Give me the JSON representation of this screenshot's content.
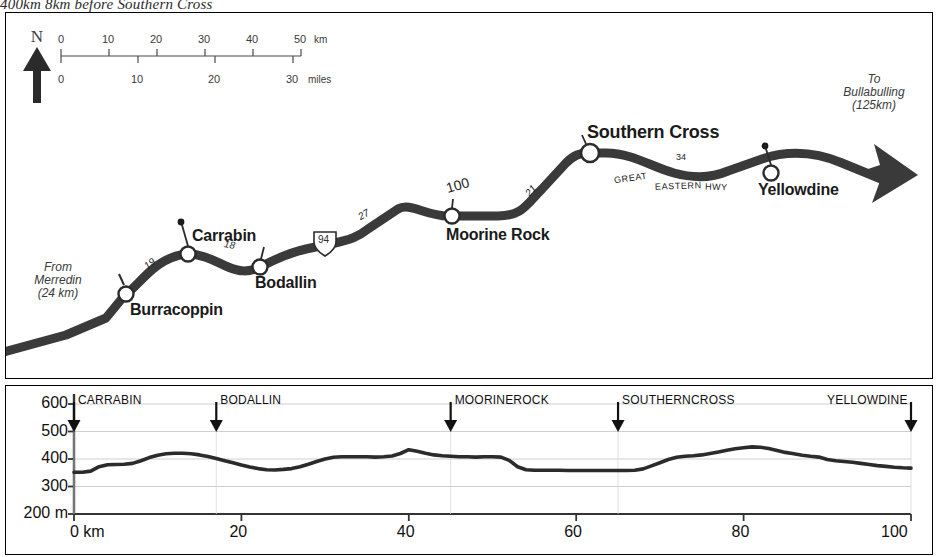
{
  "caption": "400km  8km before Southern Cross",
  "map": {
    "north_label": "N",
    "north_icon": "north-arrow-icon",
    "scale": {
      "km_ticks": [
        "0",
        "10",
        "20",
        "30",
        "40",
        "50"
      ],
      "km_unit": "km",
      "miles_ticks": [
        "0",
        "10",
        "20",
        "30"
      ],
      "miles_unit": "miles"
    },
    "origin_note": "From\nMerredin\n(24 km)",
    "origin_note_lines": [
      "From",
      "Merredin",
      "(24 km)"
    ],
    "destination_note_lines": [
      "To",
      "Bullabulling",
      "(125km)"
    ],
    "towns": [
      {
        "name": "Burracoppin"
      },
      {
        "name": "Carrabin"
      },
      {
        "name": "Bodallin"
      },
      {
        "name": "Moorine Rock"
      },
      {
        "name": "Southern Cross"
      },
      {
        "name": "Yellowdine"
      }
    ],
    "segment_distances": [
      "19",
      "18",
      "27",
      "21",
      "34"
    ],
    "road_numbers": [
      "94",
      "100"
    ],
    "highway_words": [
      "GREAT",
      "EASTERN",
      "HWY"
    ],
    "colors": {
      "road": "#3a3a3a",
      "border": "#000000",
      "text": "#1a1a1a"
    }
  },
  "chart_data": {
    "type": "line",
    "title": "",
    "xlabel": "0 km",
    "ylabel": "200 m",
    "xlim": [
      0,
      100
    ],
    "ylim": [
      200,
      600
    ],
    "grid": true,
    "yticks": [
      "200 m",
      "300",
      "400",
      "500",
      "600"
    ],
    "ytick_values": [
      200,
      300,
      400,
      500,
      600
    ],
    "xticks": [
      "0 km",
      "20",
      "40",
      "60",
      "80",
      "100"
    ],
    "xtick_values": [
      0,
      20,
      40,
      60,
      80,
      100
    ],
    "markers": [
      {
        "label": "CARRABIN",
        "km": 0
      },
      {
        "label": "BODALLIN",
        "km": 17
      },
      {
        "label": "MOORINEROCK",
        "km": 45
      },
      {
        "label": "SOUTHERNCROSS",
        "km": 65
      },
      {
        "label": "YELLOWDINE",
        "km": 100
      }
    ],
    "x": [
      0,
      1,
      2,
      3,
      4,
      5,
      6,
      7,
      8,
      9,
      10,
      11,
      12,
      13,
      14,
      15,
      16,
      17,
      18,
      19,
      20,
      21,
      22,
      23,
      24,
      25,
      26,
      27,
      28,
      29,
      30,
      31,
      32,
      33,
      34,
      35,
      36,
      37,
      38,
      39,
      40,
      41,
      42,
      43,
      44,
      45,
      46,
      47,
      48,
      49,
      50,
      51,
      52,
      53,
      54,
      55,
      56,
      57,
      58,
      59,
      60,
      61,
      62,
      63,
      64,
      65,
      66,
      67,
      68,
      69,
      70,
      71,
      72,
      73,
      74,
      75,
      76,
      77,
      78,
      79,
      80,
      81,
      82,
      83,
      84,
      85,
      86,
      87,
      88,
      89,
      90,
      91,
      92,
      93,
      94,
      95,
      96,
      97,
      98,
      99,
      100
    ],
    "values": [
      352,
      352,
      356,
      372,
      379,
      380,
      381,
      384,
      394,
      405,
      414,
      419,
      421,
      421,
      419,
      415,
      409,
      402,
      394,
      386,
      378,
      371,
      365,
      361,
      360,
      362,
      365,
      372,
      381,
      391,
      400,
      406,
      408,
      408,
      408,
      408,
      407,
      408,
      411,
      420,
      434,
      428,
      421,
      415,
      412,
      410,
      408,
      408,
      407,
      408,
      408,
      407,
      395,
      372,
      361,
      359,
      359,
      359,
      359,
      358,
      358,
      358,
      358,
      358,
      358,
      358,
      358,
      359,
      364,
      375,
      386,
      398,
      406,
      410,
      412,
      415,
      420,
      426,
      432,
      437,
      441,
      444,
      443,
      438,
      431,
      424,
      419,
      414,
      410,
      407,
      398,
      394,
      391,
      388,
      384,
      380,
      376,
      373,
      370,
      368,
      367
    ]
  }
}
